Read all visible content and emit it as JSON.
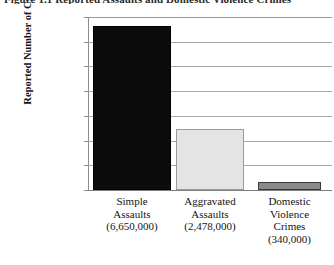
{
  "figure": {
    "caption": "Figure 1.1  Reported Assaults and Domestic Violence Crimes"
  },
  "chart_data": {
    "type": "bar",
    "title": "",
    "xlabel": "",
    "ylabel": "Reported Number of Crimes",
    "categories": [
      "Simple Assaults",
      "Aggravated Assaults",
      "Domestic Violence Crimes"
    ],
    "category_lines": [
      [
        "Simple",
        "Assaults"
      ],
      [
        "Aggravated",
        "Assaults"
      ],
      [
        "Domestic",
        "Violence",
        "Crimes"
      ]
    ],
    "value_labels": [
      "(6,650,000)",
      "(2,478,000)",
      "(340,000)"
    ],
    "values": [
      6650000,
      2478000,
      340000
    ],
    "colors": [
      "#0b0b0b",
      "#e4e4e4",
      "#8a8a8a"
    ],
    "ylim": [
      0,
      7000000
    ],
    "ytick_values": [
      7000000,
      6000000,
      5000000,
      4000000,
      3000000,
      2000000,
      1000000,
      0
    ],
    "ytick_labels": [
      "7,000,000",
      "6,000,000",
      "5,000,000",
      "4,000,000",
      "3,000,000",
      "2,000,000",
      "1,000,000",
      "0"
    ],
    "grid": true,
    "grid_color": "#a9a9a9",
    "legend": "none"
  }
}
